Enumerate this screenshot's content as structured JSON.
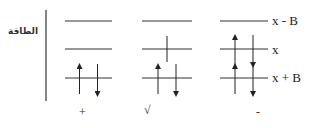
{
  "axis": {
    "label": "الطاقة"
  },
  "levels": [
    {
      "label": "x - B",
      "y": 21
    },
    {
      "label": "x",
      "y": 49
    },
    {
      "label": "x + B",
      "y": 78
    }
  ],
  "columns": [
    {
      "bottom_label": "+",
      "x1": 65,
      "x2": 112,
      "electrons": {
        "x-B": [],
        "x": [],
        "x+B": [
          "up",
          "down"
        ]
      }
    },
    {
      "bottom_label": "√",
      "x1": 142,
      "x2": 192,
      "electrons": {
        "x-B": [],
        "x": [
          "up"
        ],
        "x+B": [
          "up",
          "down"
        ]
      }
    },
    {
      "bottom_label": "-",
      "x1": 220,
      "x2": 268,
      "electrons": {
        "x-B": [],
        "x": [
          "up",
          "down"
        ],
        "x+B": [
          "up",
          "down"
        ]
      }
    }
  ],
  "colors": {
    "line": "#333333",
    "arrow": "#222222"
  }
}
